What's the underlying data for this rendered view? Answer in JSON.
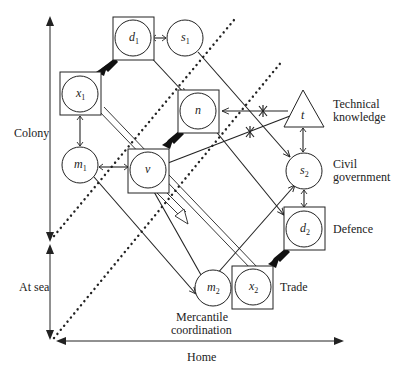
{
  "axes": {
    "vertical_colony": "Colony",
    "vertical_at_sea": "At sea",
    "horizontal_home": "Home"
  },
  "nodes": {
    "d1": {
      "base": "d",
      "sub": "1"
    },
    "s1": {
      "base": "s",
      "sub": "1"
    },
    "x1": {
      "base": "x",
      "sub": "1"
    },
    "n": {
      "base": "n",
      "sub": ""
    },
    "t": {
      "base": "t",
      "sub": ""
    },
    "m1": {
      "base": "m",
      "sub": "1"
    },
    "v": {
      "base": "v",
      "sub": ""
    },
    "s2": {
      "base": "s",
      "sub": "2"
    },
    "d2": {
      "base": "d",
      "sub": "2"
    },
    "m2": {
      "base": "m",
      "sub": "2"
    },
    "x2": {
      "base": "x",
      "sub": "2"
    }
  },
  "labels": {
    "technical_line1": "Technical",
    "technical_line2": "knowledge",
    "civil_line1": "Civil",
    "civil_line2": "government",
    "defence": "Defence",
    "trade": "Trade",
    "mercantile_line1": "Mercantile",
    "mercantile_line2": "coordination"
  },
  "colors": {
    "ink": "#222222",
    "background": "#ffffff"
  }
}
